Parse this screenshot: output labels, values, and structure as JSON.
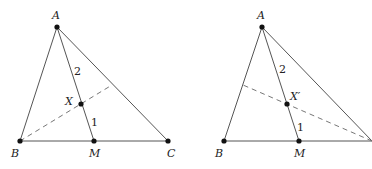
{
  "figures": [
    {
      "id": "left",
      "points": {
        "A": {
          "label": "A",
          "x": 57,
          "y": 27
        },
        "B": {
          "label": "B",
          "x": 20,
          "y": 141
        },
        "M": {
          "label": "M",
          "x": 94,
          "y": 141
        },
        "C": {
          "label": "C",
          "x": 168,
          "y": 141
        },
        "X": {
          "label": "X",
          "x": 81,
          "y": 104
        }
      },
      "dashed_end": {
        "x": 112,
        "y": 85
      },
      "ratio_labels": {
        "upper": "2",
        "lower": "1"
      }
    },
    {
      "id": "right",
      "points": {
        "A": {
          "label": "A",
          "x": 262,
          "y": 27
        },
        "B": {
          "label": "B",
          "x": 224,
          "y": 141
        },
        "M": {
          "label": "M",
          "x": 299,
          "y": 141
        },
        "C": {
          "label": "",
          "x": 372,
          "y": 141
        },
        "X": {
          "label": "X′",
          "x": 287,
          "y": 104
        }
      },
      "dashed_end": {
        "x": 243,
        "y": 85
      },
      "ratio_labels": {
        "upper": "2",
        "lower": "1"
      }
    }
  ]
}
